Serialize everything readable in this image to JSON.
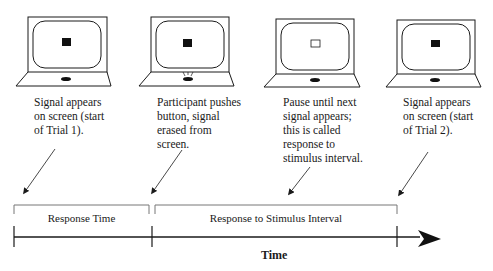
{
  "panels": [
    {
      "id": "trial1-start",
      "signal": "filled",
      "button_pressed": false,
      "caption": "Signal appears\non screen (start\nof Trial 1)."
    },
    {
      "id": "button-press",
      "signal": "filled",
      "button_pressed": true,
      "caption": "Participant pushes\nbutton, signal\nerased from\nscreen."
    },
    {
      "id": "pause",
      "signal": "empty",
      "button_pressed": false,
      "caption": "Pause until next\nsignal appears;\nthis is called\nresponse to\nstimulus interval."
    },
    {
      "id": "trial2-start",
      "signal": "filled",
      "button_pressed": false,
      "caption": "Signal appears\non screen (start\nof Trial 2)."
    }
  ],
  "timeline": {
    "intervals": [
      {
        "label": "Response Time"
      },
      {
        "label": "Response to Stimulus Interval"
      }
    ],
    "axis_label": "Time"
  },
  "colors": {
    "line": "#1a1a1a",
    "bracket": "#777777",
    "background": "#ffffff"
  }
}
